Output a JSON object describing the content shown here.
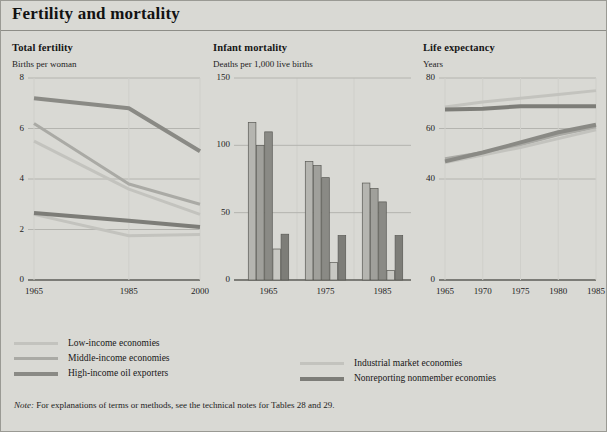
{
  "header": {
    "title": "Fertility and mortality"
  },
  "colors": {
    "background": "#d9d9d4",
    "low_income": "#c3c3be",
    "middle_income": "#aaaaa5",
    "high_income_oil": "#8a8a85",
    "industrial_market": "#c3c3be",
    "nonreporting": "#7d7d78",
    "axis": "#5d5d58",
    "gridline": "#b4b4af",
    "vgrid": "#cfcfca",
    "bar_stroke": "#5a5a55"
  },
  "legend": {
    "left": [
      {
        "label": "Low-income economies",
        "color": "#c3c3be",
        "thickness": 3
      },
      {
        "label": "Middle-income economies",
        "color": "#aaaaa5",
        "thickness": 3
      },
      {
        "label": "High-income oil exporters",
        "color": "#8a8a85",
        "thickness": 4
      }
    ],
    "right": [
      {
        "label": "Industrial market economies",
        "color": "#c3c3be",
        "thickness": 3
      },
      {
        "label": "Nonreporting nonmember economies",
        "color": "#7d7d78",
        "thickness": 4
      }
    ]
  },
  "note": {
    "prefix": "Note:",
    "text": " For explanations of terms or methods, see the technical notes for Tables 28 and 29."
  },
  "chart_data": [
    {
      "id": "total-fertility",
      "type": "line",
      "title": "Total fertility",
      "ylabel": "Births per woman",
      "xlabel": "",
      "x": [
        1965,
        1985,
        2000
      ],
      "xticks": [
        "1965",
        "1985",
        "2000"
      ],
      "yticks": [
        0,
        2,
        4,
        6,
        8
      ],
      "ylim": [
        0,
        8
      ],
      "grid": true,
      "series": [
        {
          "name": "Low-income economies",
          "color": "#aaaaa5",
          "width": 3,
          "values": [
            6.2,
            3.8,
            3.0
          ]
        },
        {
          "name": "Middle-income economies",
          "color": "#c3c3be",
          "width": 3,
          "values": [
            5.5,
            3.6,
            2.6
          ]
        },
        {
          "name": "High-income oil exporters",
          "color": "#8a8a85",
          "width": 4,
          "values": [
            7.2,
            6.8,
            5.1
          ]
        },
        {
          "name": "Industrial market economies",
          "color": "#c3c3be",
          "width": 3,
          "values": [
            2.6,
            1.75,
            1.8
          ]
        },
        {
          "name": "Nonreporting nonmember economies",
          "color": "#7d7d78",
          "width": 4,
          "values": [
            2.65,
            2.35,
            2.1
          ]
        }
      ]
    },
    {
      "id": "infant-mortality",
      "type": "bar",
      "title": "Infant mortality",
      "ylabel": "Deaths per 1,000 live births",
      "xlabel": "",
      "categories": [
        "1965",
        "1975",
        "1985"
      ],
      "xticks": [
        "1965",
        "1975",
        "1985"
      ],
      "yticks": [
        0,
        50,
        100,
        150
      ],
      "ylim": [
        0,
        150
      ],
      "grid": true,
      "series": [
        {
          "name": "Low-income economies",
          "color": "#b5b5b0",
          "values": [
            117,
            88,
            72
          ]
        },
        {
          "name": "Middle-income economies",
          "color": "#a0a09b",
          "values": [
            100,
            85,
            68
          ]
        },
        {
          "name": "High-income oil exporters",
          "color": "#8a8a85",
          "values": [
            110,
            76,
            58
          ]
        },
        {
          "name": "Industrial market economies",
          "color": "#c8c8c3",
          "values": [
            23,
            13,
            7
          ]
        },
        {
          "name": "Nonreporting nonmember economies",
          "color": "#7d7d78",
          "values": [
            34,
            33,
            33
          ]
        }
      ]
    },
    {
      "id": "life-expectancy",
      "type": "line",
      "title": "Life expectancy",
      "ylabel": "Years",
      "xlabel": "",
      "x": [
        1965,
        1970,
        1975,
        1980,
        1985
      ],
      "xticks": [
        "1965",
        "1970",
        "1975",
        "1980",
        "1985"
      ],
      "yticks": [
        0,
        40,
        60,
        80
      ],
      "ylim": [
        0,
        80
      ],
      "grid": true,
      "series": [
        {
          "name": "Low-income economies",
          "color": "#aaaaa5",
          "width": 3,
          "values": [
            48.0,
            50.5,
            53.5,
            57.5,
            60.5
          ]
        },
        {
          "name": "Middle-income economies",
          "color": "#c3c3be",
          "width": 3,
          "values": [
            46.5,
            49.5,
            52.5,
            56.0,
            59.5
          ]
        },
        {
          "name": "High-income oil exporters",
          "color": "#8a8a85",
          "width": 4,
          "values": [
            47.0,
            50.5,
            54.5,
            58.5,
            61.5
          ]
        },
        {
          "name": "Industrial market economies",
          "color": "#c3c3be",
          "width": 3,
          "values": [
            68.5,
            70.5,
            72.0,
            73.5,
            75.0
          ]
        },
        {
          "name": "Nonreporting nonmember economies",
          "color": "#7d7d78",
          "width": 4,
          "values": [
            67.5,
            67.8,
            68.8,
            68.8,
            68.8
          ]
        }
      ]
    }
  ]
}
